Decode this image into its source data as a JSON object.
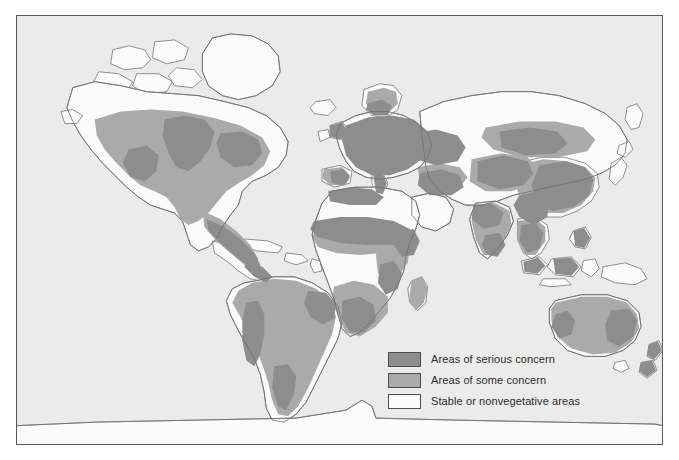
{
  "figure": {
    "kind": "world-map",
    "background_color": "#ffffff",
    "ocean_color": "#ebebeb",
    "frame_color": "#55585c",
    "coastline_color": "#6e6e6e"
  },
  "legend": {
    "items": [
      {
        "label": "Areas of serious concern",
        "color": "#8d8d8d",
        "swatch_name": "legend-swatch-serious-concern"
      },
      {
        "label": "Areas of some concern",
        "color": "#aaaaaa",
        "swatch_name": "legend-swatch-some-concern"
      },
      {
        "label": "Stable or nonvegetative areas",
        "color": "#fbfbfb",
        "swatch_name": "legend-swatch-stable"
      }
    ]
  },
  "regions": [
    {
      "name": "north-america",
      "serious": "Great Plains, central Mexico, US Southwest",
      "some": "most of United States and southern Canada",
      "stable": "northern Canada, Arctic islands, Greenland"
    },
    {
      "name": "south-america",
      "serious": "northeast Brazil, Patagonia fringe, Andean slopes",
      "some": "most of the continent",
      "stable": "Amazon basin patches"
    },
    {
      "name": "europe",
      "serious": "most of central and southern Europe",
      "some": "Scandinavia, Iberian interior",
      "stable": "far north Scandinavia"
    },
    {
      "name": "africa",
      "serious": "Sahel belt, southern Africa margins, Maghreb",
      "some": "Guinea coast, East Africa, Madagascar",
      "stable": "Sahara desert, Congo basin"
    },
    {
      "name": "asia",
      "serious": "eastern China, Central Asia, India margins, Southeast Asia",
      "some": "Siberian south, Anatolia, Iran",
      "stable": "northern Siberia, Tibetan plateau, Arabian desert"
    },
    {
      "name": "australia",
      "serious": "eastern uplands patches",
      "some": "coastal margins and rangelands",
      "stable": "central desert interior"
    },
    {
      "name": "antarctica",
      "serious": "",
      "some": "",
      "stable": "entire continent"
    }
  ]
}
